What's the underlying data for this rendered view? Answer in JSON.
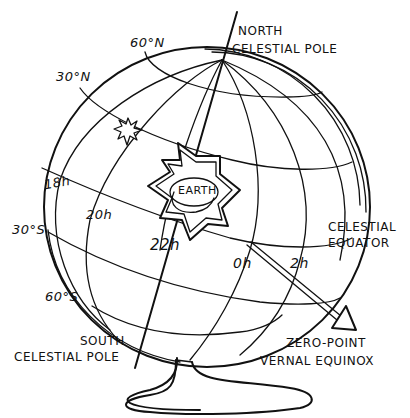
{
  "diagram": {
    "type": "celestial-globe",
    "ink_color": "#111111",
    "background": "#ffffff",
    "labels": {
      "north_pole_line1": "NORTH",
      "north_pole_line2": "CELESTIAL POLE",
      "south_pole_line1": "SOUTH",
      "south_pole_line2": "CELESTIAL POLE",
      "celestial_equator_line1": "CELESTIAL",
      "celestial_equator_line2": "EQUATOR",
      "zero_point_line1": "ZERO-POINT",
      "zero_point_line2": "VERNAL EQUINOX",
      "earth": "EARTH"
    },
    "declination_labels": {
      "n60": "60°N",
      "n30": "30°N",
      "s30": "30°S",
      "s60": "60°S"
    },
    "right_ascension_labels": {
      "h18": "18h",
      "h20": "20h",
      "h22": "22h",
      "h0": "0h",
      "h2": "2h"
    }
  }
}
